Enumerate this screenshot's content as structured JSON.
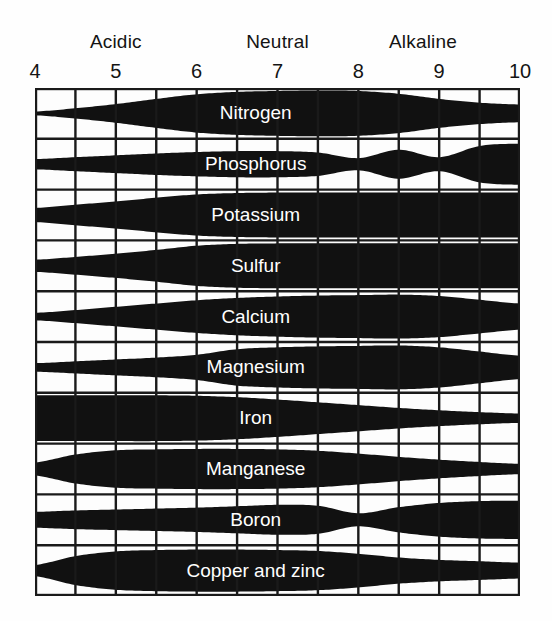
{
  "header": {
    "zones": [
      {
        "label": "Acidic",
        "center_ph": 5.0
      },
      {
        "label": "Neutral",
        "center_ph": 7.0
      },
      {
        "label": "Alkaline",
        "center_ph": 8.8
      }
    ]
  },
  "axis": {
    "ticks": [
      "4",
      "5",
      "6",
      "7",
      "8",
      "9",
      "10"
    ],
    "tick_values": [
      4,
      5,
      6,
      7,
      8,
      9,
      10
    ],
    "min": 4,
    "max": 10,
    "grid_columns": 12,
    "grid_rows": 10,
    "column_step_ph": 0.5
  },
  "colors": {
    "band": "#111111",
    "grid": "#1a1a1a",
    "background": "#fdfdfd",
    "band_label": "#ffffff",
    "text": "#141414"
  },
  "chart_data": {
    "type": "area",
    "xlabel": "pH",
    "ylabel": "",
    "xlim": [
      4,
      10
    ],
    "grid": true,
    "legend": "none",
    "annotations": [
      "Acidic",
      "Neutral",
      "Alkaline"
    ],
    "x": [
      4.0,
      4.5,
      5.0,
      5.5,
      6.0,
      6.5,
      7.0,
      7.5,
      8.0,
      8.5,
      9.0,
      9.5,
      10.0
    ],
    "note": "Each series value is the relative band thickness (0-1) at the matching pH in x[]; thickness encodes nutrient availability.",
    "series": [
      {
        "name": "Nitrogen",
        "row": 1,
        "values": [
          0.08,
          0.22,
          0.4,
          0.62,
          0.82,
          0.92,
          0.96,
          0.98,
          0.96,
          0.84,
          0.62,
          0.46,
          0.38
        ]
      },
      {
        "name": "Phosphorus",
        "row": 2,
        "values": [
          0.22,
          0.3,
          0.38,
          0.46,
          0.52,
          0.56,
          0.56,
          0.5,
          0.26,
          0.62,
          0.3,
          0.78,
          0.88
        ]
      },
      {
        "name": "Potassium",
        "row": 3,
        "values": [
          0.3,
          0.44,
          0.58,
          0.74,
          0.88,
          0.94,
          0.96,
          0.96,
          0.96,
          0.96,
          0.96,
          0.96,
          0.96
        ]
      },
      {
        "name": "Sulfur",
        "row": 4,
        "values": [
          0.26,
          0.38,
          0.52,
          0.68,
          0.86,
          0.94,
          0.96,
          0.96,
          0.96,
          0.96,
          0.96,
          0.96,
          0.96
        ]
      },
      {
        "name": "Calcium",
        "row": 5,
        "values": [
          0.16,
          0.28,
          0.42,
          0.56,
          0.7,
          0.8,
          0.86,
          0.9,
          0.92,
          0.94,
          0.88,
          0.72,
          0.56
        ]
      },
      {
        "name": "Magnesium",
        "row": 6,
        "values": [
          0.18,
          0.26,
          0.34,
          0.42,
          0.54,
          0.78,
          0.86,
          0.9,
          0.92,
          0.94,
          0.86,
          0.68,
          0.5
        ]
      },
      {
        "name": "Iron",
        "row": 7,
        "values": [
          0.98,
          0.98,
          0.98,
          0.98,
          0.96,
          0.9,
          0.8,
          0.68,
          0.56,
          0.44,
          0.34,
          0.26,
          0.2
        ]
      },
      {
        "name": "Manganese",
        "row": 8,
        "values": [
          0.28,
          0.62,
          0.8,
          0.84,
          0.86,
          0.86,
          0.84,
          0.78,
          0.66,
          0.52,
          0.4,
          0.3,
          0.22
        ]
      },
      {
        "name": "Boron",
        "row": 9,
        "values": [
          0.34,
          0.4,
          0.44,
          0.48,
          0.52,
          0.58,
          0.64,
          0.6,
          0.28,
          0.54,
          0.72,
          0.8,
          0.82
        ]
      },
      {
        "name": "Copper and zinc",
        "row": 10,
        "values": [
          0.24,
          0.62,
          0.82,
          0.88,
          0.9,
          0.9,
          0.88,
          0.84,
          0.72,
          0.56,
          0.46,
          0.4,
          0.34
        ]
      }
    ]
  }
}
